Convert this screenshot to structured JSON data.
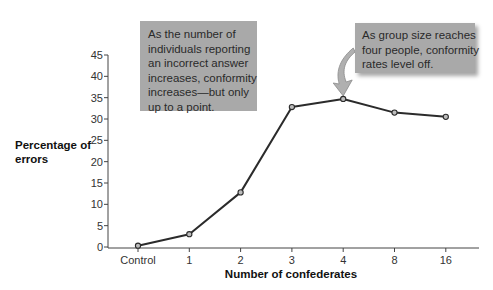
{
  "chart_data": {
    "type": "line",
    "title": "",
    "xlabel": "Number of confederates",
    "ylabel": "Percentage of errors",
    "ylabel_lines": [
      "Percentage of",
      "errors"
    ],
    "categories": [
      "Control",
      "1",
      "2",
      "3",
      "4",
      "8",
      "16"
    ],
    "series": [
      {
        "name": "Percentage of errors",
        "values": [
          0.3,
          3,
          12.8,
          32.8,
          34.7,
          31.5,
          30.5
        ]
      }
    ],
    "ylim": [
      0,
      45
    ],
    "yticks": [
      0,
      5,
      10,
      15,
      20,
      25,
      30,
      35,
      40,
      45
    ],
    "grid": false,
    "legend": "none",
    "annotations": [
      {
        "id": "left",
        "lines": [
          "As the number of",
          "individuals reporting",
          "an incorrect answer",
          "increases, conformity",
          "increases—but only",
          "up to a point."
        ]
      },
      {
        "id": "right",
        "lines": [
          "As group size reaches",
          "four people, conformity",
          "rates level off."
        ],
        "points_to": "4"
      }
    ]
  },
  "colors": {
    "line": "#2b2b2b",
    "marker_fill": "#bdbdbd",
    "callout_fill": "#a9a9a9",
    "arrow_fill": "#b0b0b0"
  }
}
